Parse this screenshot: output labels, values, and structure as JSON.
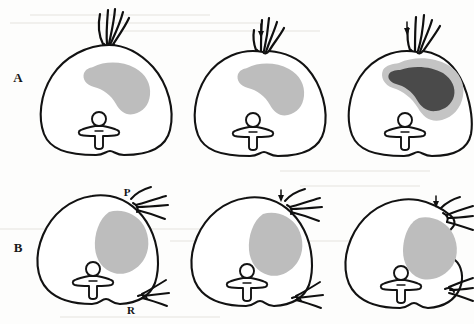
{
  "figure": {
    "background_color": "#fdfdfc",
    "ink_color": "#121212",
    "rows": [
      {
        "row_label": "A",
        "label_x": 18,
        "label_y": 82,
        "description": "Upper row: three axial sections with apical strand tuft and crescent lesion",
        "panels": [
          {
            "panel_id": "A1",
            "lesion_tone": "#bdbdbd",
            "lesion_shape": "crescent",
            "has_strand_tuft": true,
            "has_arrow": false,
            "arrow_symbol": "",
            "has_dark_core": false,
            "markers": []
          },
          {
            "panel_id": "A2",
            "lesion_tone": "#bdbdbd",
            "lesion_shape": "crescent",
            "has_strand_tuft": true,
            "has_arrow": true,
            "arrow_symbol": "down-arrow",
            "has_dark_core": false,
            "markers": []
          },
          {
            "panel_id": "A3",
            "lesion_tone": "#c4c4c4",
            "lesion_shape": "crescent-with-core",
            "has_strand_tuft": true,
            "has_arrow": true,
            "arrow_symbol": "down-arrow",
            "has_dark_core": true,
            "dark_core_tone": "#4a4a4a",
            "markers": []
          }
        ]
      },
      {
        "row_label": "B",
        "label_x": 18,
        "label_y": 252,
        "description": "Lower row: three axial sections with lateral vessel bundles and rounded lesion",
        "panels": [
          {
            "panel_id": "B1",
            "lesion_tone": "#bdbdbd",
            "lesion_shape": "rounded",
            "has_strand_tuft": false,
            "has_arrow": false,
            "arrow_symbol": "",
            "has_dark_core": false,
            "markers": [
              {
                "text": "P",
                "position": "upper-right",
                "x": 127,
                "y": 196
              },
              {
                "text": "R",
                "position": "lower-right",
                "x": 131,
                "y": 312
              }
            ]
          },
          {
            "panel_id": "B2",
            "lesion_tone": "#bdbdbd",
            "lesion_shape": "rounded",
            "has_strand_tuft": false,
            "has_arrow": true,
            "arrow_symbol": "down-arrow",
            "has_dark_core": false,
            "markers": []
          },
          {
            "panel_id": "B3",
            "lesion_tone": "#bdbdbd",
            "lesion_shape": "rounded-bulging",
            "has_strand_tuft": false,
            "has_arrow": true,
            "arrow_symbol": "down-arrow",
            "has_dark_core": false,
            "markers": []
          }
        ]
      }
    ],
    "legend_symbols": {
      "P": "P",
      "R": "R",
      "arrow": "↓"
    }
  }
}
